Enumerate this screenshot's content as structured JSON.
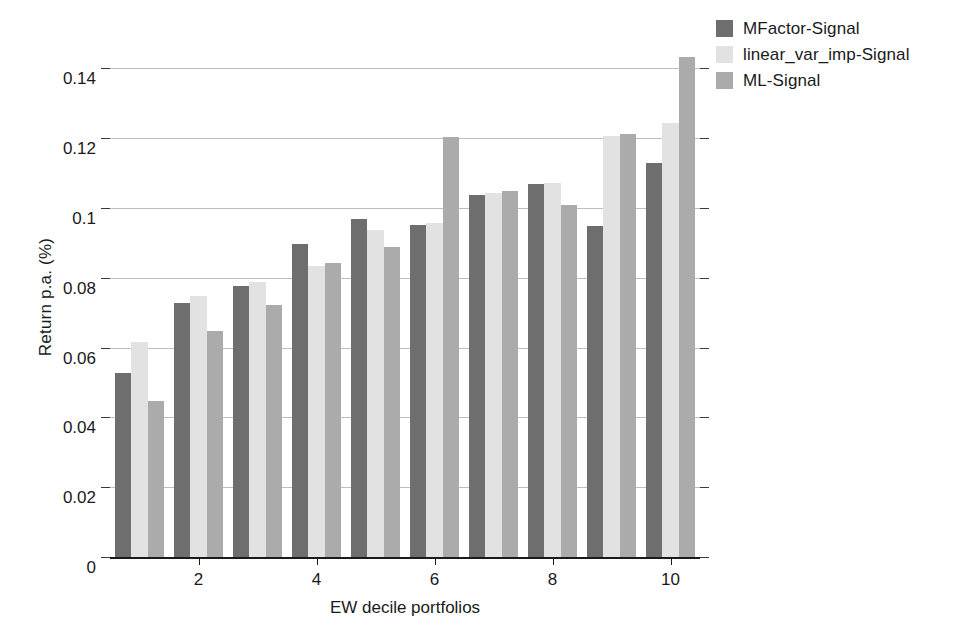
{
  "chart_data": {
    "type": "bar",
    "title": "",
    "xlabel": "EW decile portfolios",
    "ylabel": "Return p.a. (%)",
    "categories": [
      "1",
      "2",
      "3",
      "4",
      "5",
      "6",
      "7",
      "8",
      "9",
      "10"
    ],
    "xtick_labels": [
      "2",
      "4",
      "6",
      "8",
      "10"
    ],
    "xtick_categories": [
      "2",
      "4",
      "6",
      "8",
      "10"
    ],
    "ylim": [
      0,
      0.1475
    ],
    "ytick_labels": [
      "0",
      "0.02",
      "0.04",
      "0.06",
      "0.08",
      "0.1",
      "0.12",
      "0.14"
    ],
    "ytick_values": [
      0,
      0.02,
      0.04,
      0.06,
      0.08,
      0.1,
      0.12,
      0.14
    ],
    "grid": true,
    "legend_position": "top-right",
    "series": [
      {
        "name": "MFactor-Signal",
        "color": "#6e6e6e",
        "values": [
          0.053,
          0.073,
          0.078,
          0.09,
          0.097,
          0.0955,
          0.104,
          0.107,
          0.095,
          0.113
        ]
      },
      {
        "name": "linear_var_imp-Signal",
        "color": "#e2e2e2",
        "values": [
          0.062,
          0.075,
          0.079,
          0.0835,
          0.094,
          0.096,
          0.1045,
          0.1075,
          0.121,
          0.1245
        ]
      },
      {
        "name": "ML-Signal",
        "color": "#ababab",
        "values": [
          0.045,
          0.065,
          0.0725,
          0.0845,
          0.089,
          0.1205,
          0.105,
          0.101,
          0.1215,
          0.1435
        ]
      }
    ]
  },
  "legend": {
    "items": [
      {
        "label": "MFactor-Signal"
      },
      {
        "label": "linear_var_imp-Signal"
      },
      {
        "label": "ML-Signal"
      }
    ]
  }
}
